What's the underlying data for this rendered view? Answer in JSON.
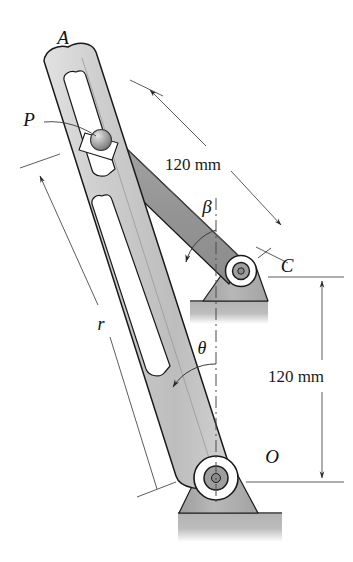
{
  "figure": {
    "background_color": "#ffffff",
    "line_color": "#1a1a1a",
    "labels": {
      "point_a": "A",
      "point_p": "P",
      "point_c": "C",
      "point_o": "O",
      "radius_r": "r",
      "angle_theta": "θ",
      "angle_beta": "β"
    },
    "dimensions": {
      "crank_length": "120 mm",
      "pivot_separation": "120 mm"
    },
    "colors": {
      "arm_light_fill": "#c9c9c9",
      "arm_dark_fill": "#9a9a9a",
      "ground_fill": "#b5b5b5",
      "bracket_fill": "#b0b0b0",
      "slider_fill": "#a8a8a8",
      "outline": "#1a1a1a"
    },
    "geometry": {
      "pivot_o": {
        "x": 216,
        "y": 478
      },
      "pivot_c": {
        "x": 241,
        "y": 271
      },
      "slider_p": {
        "x": 101,
        "y": 137
      },
      "arm_tip_a": {
        "x": 62,
        "y": 62
      }
    },
    "annotations": {
      "theta_description": "Angle of slotted arm from vertical at O",
      "beta_description": "Angle of crank arm from vertical at C",
      "r_description": "Distance from O to slider P along slotted arm"
    }
  }
}
